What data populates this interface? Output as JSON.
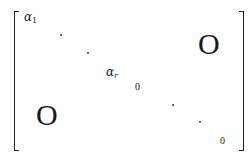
{
  "matrix": {
    "alpha_1": {
      "base": "α",
      "subscript": "1"
    },
    "alpha_r": {
      "base": "α",
      "subscript": "r"
    },
    "top_right_block": "O",
    "bottom_left_block": "O",
    "diag_zero_1": "0",
    "diag_zero_2": "0"
  }
}
